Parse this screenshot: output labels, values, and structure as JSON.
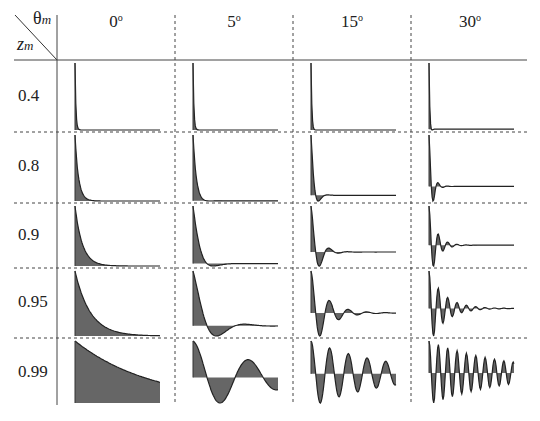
{
  "corner": {
    "col_symbol": "θ",
    "col_sub": "m",
    "row_symbol": "z",
    "row_sub": "m"
  },
  "columns": [
    {
      "label": "0",
      "unit": "o"
    },
    {
      "label": "5",
      "unit": "o"
    },
    {
      "label": "15",
      "unit": "o"
    },
    {
      "label": "30",
      "unit": "o"
    }
  ],
  "rows": [
    "0.4",
    "0.8",
    "0.9",
    "0.95",
    "0.99"
  ],
  "chart_data": {
    "type": "table",
    "xlabel": "θ_m",
    "ylabel": "z_m",
    "col_categories": [
      "0°",
      "5°",
      "15°",
      "30°"
    ],
    "row_categories": [
      "0.4",
      "0.8",
      "0.9",
      "0.95",
      "0.99"
    ],
    "cell_model": "h[n] = z_m^n · cos(θ_m · n), stem plot with filled envelope",
    "colors": {
      "fill": "#555555",
      "line": "#222222",
      "grid": "#444444"
    },
    "grid": {
      "header_line": "solid",
      "separators": "dashed"
    }
  }
}
